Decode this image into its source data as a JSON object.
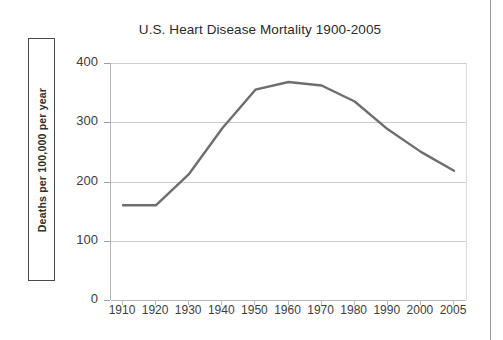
{
  "chart_data": {
    "type": "line",
    "title": "U.S. Heart Disease Mortality 1900-2005",
    "xlabel": "",
    "ylabel": "Deaths per 100,000 per year",
    "x": [
      1910,
      1920,
      1930,
      1940,
      1950,
      1960,
      1970,
      1980,
      1990,
      2000,
      2005
    ],
    "xtick_labels": [
      "1910",
      "1920",
      "1930",
      "1940",
      "1950",
      "1960",
      "1970",
      "1980",
      "1990",
      "2000",
      "2005"
    ],
    "values": [
      160,
      160,
      213,
      290,
      355,
      368,
      362,
      335,
      288,
      250,
      218
    ],
    "series": [
      {
        "name": "U.S. Heart Disease Mortality",
        "values": [
          160,
          160,
          213,
          290,
          355,
          368,
          362,
          335,
          288,
          250,
          218
        ]
      }
    ],
    "ylim": [
      0,
      400
    ],
    "ytick_labels": [
      "0",
      "100",
      "200",
      "300",
      "400"
    ],
    "ytick_values": [
      0,
      100,
      200,
      300,
      400
    ],
    "grid": "horizontal",
    "legend": "none",
    "line_color": "#6e6e6e",
    "grid_color": "#cdcdcd",
    "title_color": "#2b2b2b",
    "axis_text_color": "#3d3d3d"
  }
}
